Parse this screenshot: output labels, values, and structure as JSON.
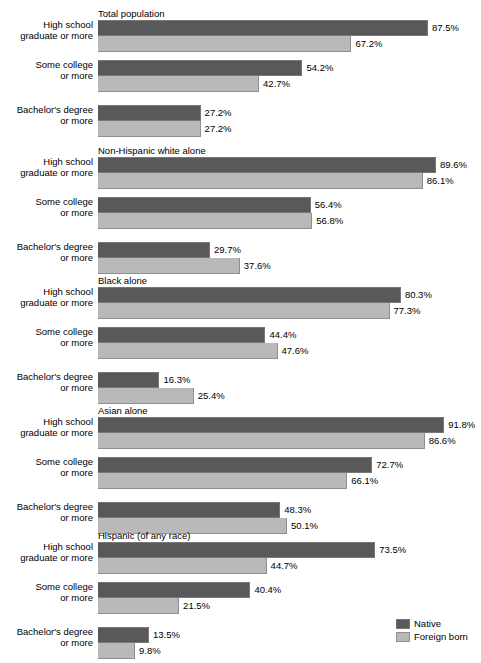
{
  "chart_data": {
    "type": "bar",
    "title": "",
    "xlabel": "",
    "ylabel": "",
    "xlim": [
      0,
      100
    ],
    "grid": false,
    "orientation": "horizontal",
    "legend_position": "bottom-right",
    "legend": [
      "Native",
      "Foreign born"
    ],
    "categories": [
      "High school graduate or more",
      "Some college or more",
      "Bachelor's degree or more"
    ],
    "colors": {
      "native": "#595959",
      "foreign": "#b9b9b9"
    },
    "groups": [
      {
        "title": "Total population",
        "rows": [
          {
            "label_line1": "High school",
            "label_line2": "graduate or more",
            "native": 87.5,
            "native_text": "87.5%",
            "foreign": 67.2,
            "foreign_text": "67.2%"
          },
          {
            "label_line1": "Some college",
            "label_line2": "or more",
            "native": 54.2,
            "native_text": "54.2%",
            "foreign": 42.7,
            "foreign_text": "42.7%"
          },
          {
            "label_line1": "Bachelor's degree",
            "label_line2": "or more",
            "native": 27.2,
            "native_text": "27.2%",
            "foreign": 27.2,
            "foreign_text": "27.2%"
          }
        ]
      },
      {
        "title": "Non-Hispanic white alone",
        "rows": [
          {
            "label_line1": "High school",
            "label_line2": "graduate or more",
            "native": 89.6,
            "native_text": "89.6%",
            "foreign": 86.1,
            "foreign_text": "86.1%"
          },
          {
            "label_line1": "Some college",
            "label_line2": "or more",
            "native": 56.4,
            "native_text": "56.4%",
            "foreign": 56.8,
            "foreign_text": "56.8%"
          },
          {
            "label_line1": "Bachelor's degree",
            "label_line2": "or more",
            "native": 29.7,
            "native_text": "29.7%",
            "foreign": 37.6,
            "foreign_text": "37.6%"
          }
        ]
      },
      {
        "title": "Black alone",
        "rows": [
          {
            "label_line1": "High school",
            "label_line2": "graduate or more",
            "native": 80.3,
            "native_text": "80.3%",
            "foreign": 77.3,
            "foreign_text": "77.3%"
          },
          {
            "label_line1": "Some college",
            "label_line2": "or more",
            "native": 44.4,
            "native_text": "44.4%",
            "foreign": 47.6,
            "foreign_text": "47.6%"
          },
          {
            "label_line1": "Bachelor's degree",
            "label_line2": "or more",
            "native": 16.3,
            "native_text": "16.3%",
            "foreign": 25.4,
            "foreign_text": "25.4%"
          }
        ]
      },
      {
        "title": "Asian alone",
        "rows": [
          {
            "label_line1": "High school",
            "label_line2": "graduate or more",
            "native": 91.8,
            "native_text": "91.8%",
            "foreign": 86.6,
            "foreign_text": "86.6%"
          },
          {
            "label_line1": "Some college",
            "label_line2": "or more",
            "native": 72.7,
            "native_text": "72.7%",
            "foreign": 66.1,
            "foreign_text": "66.1%"
          },
          {
            "label_line1": "Bachelor's degree",
            "label_line2": "or more",
            "native": 48.3,
            "native_text": "48.3%",
            "foreign": 50.1,
            "foreign_text": "50.1%"
          }
        ]
      },
      {
        "title": "Hispanic (of any race)",
        "rows": [
          {
            "label_line1": "High school",
            "label_line2": "graduate or more",
            "native": 73.5,
            "native_text": "73.5%",
            "foreign": 44.7,
            "foreign_text": "44.7%"
          },
          {
            "label_line1": "Some college",
            "label_line2": "or more",
            "native": 40.4,
            "native_text": "40.4%",
            "foreign": 21.5,
            "foreign_text": "21.5%"
          },
          {
            "label_line1": "Bachelor's degree",
            "label_line2": "or more",
            "native": 13.5,
            "native_text": "13.5%",
            "foreign": 9.8,
            "foreign_text": "9.8%"
          }
        ]
      }
    ]
  },
  "legend": {
    "items": [
      {
        "label": "Native",
        "series": "native"
      },
      {
        "label": "Foreign born",
        "series": "foreign"
      }
    ]
  }
}
